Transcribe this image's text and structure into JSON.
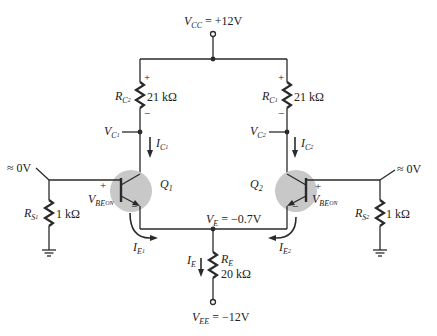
{
  "supply": {
    "vcc": {
      "symbol": "V",
      "sub": "CC",
      "value": "= +12V"
    },
    "vee": {
      "symbol": "V",
      "sub": "EE",
      "value": "= −12V"
    }
  },
  "resistors": {
    "rc_left": {
      "symbol": "R",
      "sub": "C",
      "subsub": "2",
      "value": "21 kΩ",
      "plus": "+",
      "minus": "−"
    },
    "rc_right": {
      "symbol": "R",
      "sub": "C",
      "subsub": "1",
      "value": "21 kΩ",
      "plus": "+",
      "minus": "−"
    },
    "rs_left": {
      "symbol": "R",
      "sub": "S",
      "subsub": "1",
      "value": "1 kΩ"
    },
    "rs_right": {
      "symbol": "R",
      "sub": "S",
      "subsub": "2",
      "value": "1 kΩ"
    },
    "re": {
      "symbol": "R",
      "sub": "E",
      "value": "20 kΩ"
    }
  },
  "nodes": {
    "vc1": {
      "symbol": "V",
      "sub": "C",
      "subsub": "1"
    },
    "vc2": {
      "symbol": "V",
      "sub": "C",
      "subsub": "2"
    },
    "ve": {
      "symbol": "V",
      "sub": "E",
      "value": "= −0.7V"
    },
    "base_left": "≈ 0V",
    "base_right": "≈ 0V"
  },
  "currents": {
    "ic1": {
      "symbol": "I",
      "sub": "C",
      "subsub": "1"
    },
    "ic2": {
      "symbol": "I",
      "sub": "C",
      "subsub": "2"
    },
    "ie1": {
      "symbol": "I",
      "sub": "E",
      "subsub": "1"
    },
    "ie2": {
      "symbol": "I",
      "sub": "E",
      "subsub": "2"
    },
    "ie": {
      "symbol": "I",
      "sub": "E"
    }
  },
  "transistors": {
    "q1": {
      "symbol": "Q",
      "sub": "1",
      "vbe": {
        "symbol": "V",
        "sub": "BE",
        "subsub": "ON"
      },
      "plus": "+",
      "minus": "−"
    },
    "q2": {
      "symbol": "Q",
      "sub": "2",
      "vbe": {
        "symbol": "V",
        "sub": "BE",
        "subsub": "ON"
      },
      "plus": "+",
      "minus": "−"
    }
  },
  "colors": {
    "wire": "#2a2a2a",
    "transistor_highlight": "#c8c8c8",
    "background": "#ffffff"
  }
}
